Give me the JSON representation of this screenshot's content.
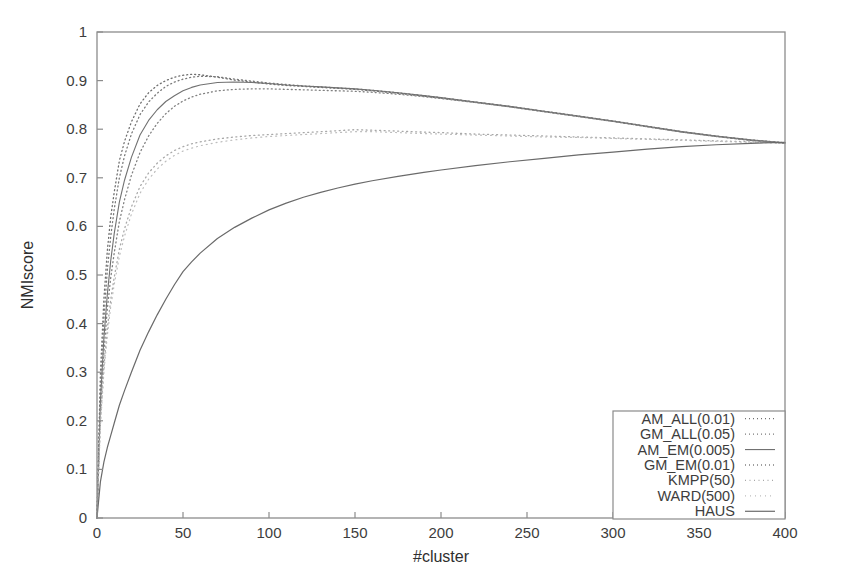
{
  "chart_data": {
    "type": "line",
    "title": "",
    "xlabel": "#cluster",
    "ylabel": "NMIscore",
    "xlim": [
      0,
      400
    ],
    "ylim": [
      0,
      1
    ],
    "grid": false,
    "legend_position": "bottom-right",
    "xticks": [
      0,
      50,
      100,
      150,
      200,
      250,
      300,
      350,
      400
    ],
    "xtick_labels": [
      "0",
      "50",
      "100",
      "150",
      "200",
      "250",
      "300",
      "350",
      "400"
    ],
    "yticks": [
      0,
      0.1,
      0.2,
      0.3,
      0.4,
      0.5,
      0.6,
      0.7,
      0.8,
      0.9,
      1
    ],
    "ytick_labels": [
      "0",
      "0.1",
      "0.2",
      "0.3",
      "0.4",
      "0.5",
      "0.6",
      "0.7",
      "0.8",
      "0.9",
      "1"
    ],
    "x": [
      0,
      2,
      4,
      6,
      8,
      10,
      13,
      16,
      20,
      25,
      30,
      35,
      40,
      45,
      50,
      55,
      60,
      70,
      80,
      90,
      100,
      110,
      120,
      130,
      140,
      150,
      160,
      175,
      190,
      200,
      220,
      240,
      260,
      280,
      300,
      320,
      340,
      360,
      380,
      400
    ],
    "series": [
      {
        "name": "AM_ALL(0.01)",
        "color": "#6f6f6f",
        "dash": "1,3",
        "width": 1.3,
        "values": [
          0.0,
          0.3,
          0.45,
          0.55,
          0.62,
          0.67,
          0.735,
          0.775,
          0.815,
          0.852,
          0.875,
          0.89,
          0.9,
          0.907,
          0.911,
          0.913,
          0.912,
          0.907,
          0.901,
          0.897,
          0.893,
          0.89,
          0.888,
          0.886,
          0.884,
          0.882,
          0.879,
          0.874,
          0.868,
          0.864,
          0.855,
          0.846,
          0.836,
          0.826,
          0.816,
          0.805,
          0.794,
          0.785,
          0.777,
          0.771
        ]
      },
      {
        "name": "GM_ALL(0.05)",
        "color": "#7a7a7a",
        "dash": "1,3",
        "width": 1.3,
        "values": [
          0.0,
          0.27,
          0.41,
          0.51,
          0.58,
          0.635,
          0.7,
          0.745,
          0.79,
          0.83,
          0.856,
          0.874,
          0.888,
          0.897,
          0.903,
          0.907,
          0.909,
          0.908,
          0.903,
          0.899,
          0.895,
          0.892,
          0.889,
          0.887,
          0.885,
          0.883,
          0.88,
          0.875,
          0.869,
          0.865,
          0.856,
          0.847,
          0.837,
          0.827,
          0.817,
          0.806,
          0.795,
          0.786,
          0.778,
          0.772
        ]
      },
      {
        "name": "AM_EM(0.005)",
        "color": "#717171",
        "dash": "0",
        "width": 1.1,
        "values": [
          0.0,
          0.24,
          0.37,
          0.46,
          0.53,
          0.585,
          0.65,
          0.695,
          0.742,
          0.788,
          0.818,
          0.84,
          0.857,
          0.869,
          0.879,
          0.886,
          0.891,
          0.896,
          0.897,
          0.896,
          0.894,
          0.891,
          0.889,
          0.887,
          0.885,
          0.883,
          0.88,
          0.875,
          0.869,
          0.865,
          0.856,
          0.847,
          0.837,
          0.827,
          0.817,
          0.806,
          0.795,
          0.786,
          0.778,
          0.772
        ]
      },
      {
        "name": "GM_EM(0.01)",
        "color": "#808080",
        "dash": "1,3",
        "width": 1.3,
        "values": [
          0.0,
          0.22,
          0.34,
          0.43,
          0.495,
          0.545,
          0.61,
          0.655,
          0.705,
          0.752,
          0.786,
          0.812,
          0.832,
          0.847,
          0.858,
          0.866,
          0.872,
          0.879,
          0.882,
          0.883,
          0.883,
          0.882,
          0.881,
          0.88,
          0.879,
          0.878,
          0.876,
          0.872,
          0.867,
          0.863,
          0.855,
          0.846,
          0.836,
          0.826,
          0.816,
          0.805,
          0.794,
          0.785,
          0.777,
          0.771
        ]
      },
      {
        "name": "KMPP(50)",
        "color": "#a8a8a8",
        "dash": "1,3.5",
        "width": 1.3,
        "values": [
          0.0,
          0.2,
          0.31,
          0.39,
          0.45,
          0.495,
          0.553,
          0.595,
          0.64,
          0.682,
          0.71,
          0.73,
          0.745,
          0.756,
          0.764,
          0.77,
          0.774,
          0.78,
          0.784,
          0.787,
          0.789,
          0.791,
          0.793,
          0.795,
          0.797,
          0.799,
          0.798,
          0.796,
          0.794,
          0.793,
          0.79,
          0.788,
          0.786,
          0.784,
          0.782,
          0.78,
          0.778,
          0.776,
          0.774,
          0.772
        ]
      },
      {
        "name": "WARD(500)",
        "color": "#bdbdbd",
        "dash": "1,4",
        "width": 1.2,
        "values": [
          0.0,
          0.19,
          0.3,
          0.375,
          0.435,
          0.48,
          0.538,
          0.58,
          0.625,
          0.668,
          0.697,
          0.718,
          0.734,
          0.746,
          0.755,
          0.761,
          0.766,
          0.773,
          0.778,
          0.782,
          0.785,
          0.787,
          0.789,
          0.791,
          0.793,
          0.795,
          0.795,
          0.793,
          0.791,
          0.79,
          0.788,
          0.786,
          0.784,
          0.783,
          0.781,
          0.779,
          0.777,
          0.775,
          0.773,
          0.771
        ]
      },
      {
        "name": "HAUS",
        "color": "#6a6a6a",
        "dash": "0",
        "width": 1.2,
        "values": [
          0.0,
          0.075,
          0.115,
          0.145,
          0.17,
          0.195,
          0.232,
          0.262,
          0.3,
          0.345,
          0.383,
          0.418,
          0.45,
          0.48,
          0.507,
          0.527,
          0.545,
          0.575,
          0.598,
          0.617,
          0.634,
          0.648,
          0.66,
          0.67,
          0.679,
          0.687,
          0.694,
          0.703,
          0.711,
          0.716,
          0.725,
          0.733,
          0.74,
          0.747,
          0.753,
          0.759,
          0.764,
          0.768,
          0.771,
          0.773
        ]
      }
    ]
  },
  "legend": {
    "entries": [
      {
        "label": "AM_ALL(0.01)"
      },
      {
        "label": "GM_ALL(0.05)"
      },
      {
        "label": "AM_EM(0.005)"
      },
      {
        "label": "GM_EM(0.01)"
      },
      {
        "label": "KMPP(50)"
      },
      {
        "label": "WARD(500)"
      },
      {
        "label": "HAUS"
      }
    ]
  },
  "axes": {
    "x_title": "#cluster",
    "y_title": "NMIscore"
  }
}
